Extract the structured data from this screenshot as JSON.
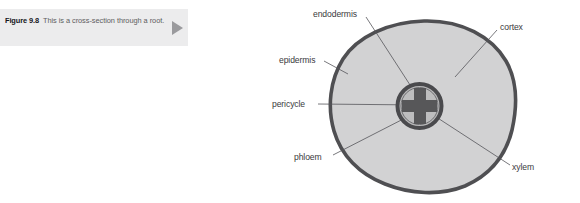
{
  "caption": {
    "figure_label": "Figure 9.8",
    "body_text": "This is a cross-section through a root.",
    "arrow_icon": "play-triangle-icon",
    "panel_color": "#ececed"
  },
  "diagram": {
    "colors": {
      "epidermis_border": "#4f4f52",
      "cortex_fill": "#d2d2d3",
      "stele_ring": "#4a4a4d",
      "xylem_fill": "#575759",
      "leader_line": "#56565a",
      "label_text": "#3a3a3d"
    },
    "labels": [
      {
        "id": "endodermis",
        "text": "endodermis"
      },
      {
        "id": "cortex",
        "text": "cortex"
      },
      {
        "id": "epidermis",
        "text": "epidermis"
      },
      {
        "id": "pericycle",
        "text": "pericycle"
      },
      {
        "id": "phloem",
        "text": "phloem"
      },
      {
        "id": "xylem",
        "text": "xylem"
      }
    ]
  }
}
